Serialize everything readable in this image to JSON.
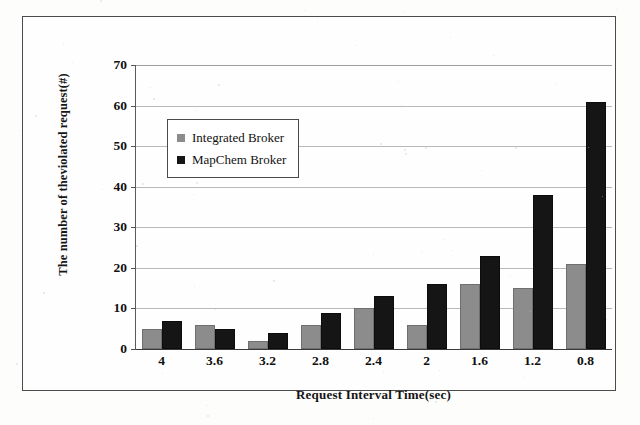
{
  "chart_data": {
    "type": "bar",
    "title": "",
    "categories": [
      "4",
      "3.6",
      "3.2",
      "2.8",
      "2.4",
      "2",
      "1.6",
      "1.2",
      "0.8"
    ],
    "series": [
      {
        "name": "Integrated Broker",
        "color": "#8c8c8c",
        "values": [
          5,
          6,
          2,
          6,
          10,
          6,
          16,
          15,
          21
        ]
      },
      {
        "name": "MapChem Broker",
        "color": "#151515",
        "values": [
          7,
          5,
          4,
          9,
          13,
          16,
          23,
          38,
          61
        ]
      }
    ],
    "xlabel": "Request Interval Time(sec)",
    "ylabel": "The number of theviolated request(#)",
    "ylim": [
      0,
      70
    ],
    "yticks": [
      "0",
      "10",
      "20",
      "30",
      "40",
      "50",
      "60",
      "70"
    ],
    "grid": true,
    "legend_position": "upper-left-inside"
  },
  "legend": {
    "items": [
      {
        "label": "Integrated Broker",
        "color": "#8c8c8c"
      },
      {
        "label": "MapChem Broker",
        "color": "#151515"
      }
    ]
  }
}
